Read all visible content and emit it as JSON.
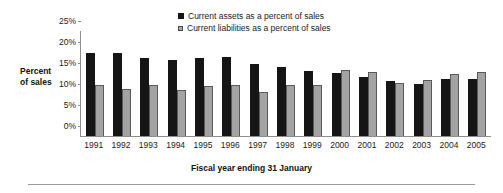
{
  "chart_data": {
    "type": "bar",
    "title": "",
    "subtitle": "",
    "xlabel": "Fiscal year ending 31 January",
    "ylabel": "Percent of sales",
    "ylabel_line1": "Percent",
    "ylabel_line2": "of sales",
    "ylim": [
      0,
      25
    ],
    "ytick_labels": [
      "25%",
      "20%",
      "15%",
      "10%",
      "5%",
      "0%"
    ],
    "ytick_values": [
      25,
      20,
      15,
      10,
      5,
      0
    ],
    "grid": false,
    "legend_position": "top-center",
    "categories": [
      "1991",
      "1992",
      "1993",
      "1994",
      "1995",
      "1996",
      "1997",
      "1998",
      "1999",
      "2000",
      "2001",
      "2002",
      "2003",
      "2004",
      "2005"
    ],
    "series": [
      {
        "name": "Current assets as a percent of sales",
        "color": "#151515",
        "values": [
          19.7,
          19.7,
          18.5,
          18.1,
          18.6,
          18.7,
          17.2,
          16.5,
          15.4,
          14.9,
          14.0,
          13.0,
          12.4,
          13.5,
          13.6
        ]
      },
      {
        "name": "Current liabilities as a percent of sales",
        "color": "#a3a3a3",
        "values": [
          12.2,
          11.2,
          12.1,
          10.9,
          12.0,
          12.2,
          10.4,
          12.2,
          12.2,
          15.7,
          15.2,
          12.6,
          13.3,
          14.7,
          15.3
        ]
      }
    ]
  }
}
